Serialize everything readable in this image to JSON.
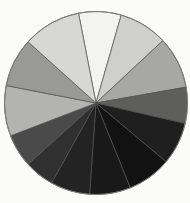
{
  "figure": {
    "background": "#fbfbfa",
    "outline_color": "#7a7a78",
    "divider_color": "#4f4f4f"
  },
  "chart_data": {
    "type": "pie",
    "title": "",
    "xlabel": "",
    "ylabel": "",
    "legend": "none",
    "data_labels": "none",
    "angle_unit": "degrees clockwise from 12 o'clock",
    "center": {
      "x": 96,
      "y": 103
    },
    "radius": 91.5,
    "slices": [
      {
        "name": "slice-white-top",
        "start": 349,
        "end": 16,
        "sweep_deg": 27,
        "pct": 7.5,
        "fill": "#f3f3f1"
      },
      {
        "name": "slice-light-gray-1",
        "start": 16,
        "end": 47,
        "sweep_deg": 31,
        "pct": 8.6,
        "fill": "#cfcfcd"
      },
      {
        "name": "slice-medium-gray-1",
        "start": 47,
        "end": 80,
        "sweep_deg": 33,
        "pct": 9.2,
        "fill": "#a7a7a5"
      },
      {
        "name": "slice-dark-gray-right",
        "start": 80,
        "end": 103,
        "sweep_deg": 23,
        "pct": 6.4,
        "fill": "#5e5e5c"
      },
      {
        "name": "slice-near-black-1",
        "start": 103,
        "end": 130,
        "sweep_deg": 27,
        "pct": 7.5,
        "fill": "#1f1f1f"
      },
      {
        "name": "slice-near-black-2",
        "start": 130,
        "end": 158,
        "sweep_deg": 28,
        "pct": 7.8,
        "fill": "#121212"
      },
      {
        "name": "slice-near-black-3",
        "start": 158,
        "end": 184,
        "sweep_deg": 26,
        "pct": 7.2,
        "fill": "#191919"
      },
      {
        "name": "slice-near-black-4",
        "start": 184,
        "end": 209,
        "sweep_deg": 25,
        "pct": 6.9,
        "fill": "#232323"
      },
      {
        "name": "slice-very-dark-left",
        "start": 209,
        "end": 228,
        "sweep_deg": 19,
        "pct": 5.3,
        "fill": "#303030"
      },
      {
        "name": "slice-dark-gray-left",
        "start": 228,
        "end": 249,
        "sweep_deg": 21,
        "pct": 5.8,
        "fill": "#4a4a4a"
      },
      {
        "name": "slice-light-med-gray",
        "start": 249,
        "end": 281,
        "sweep_deg": 32,
        "pct": 8.9,
        "fill": "#b3b3b1"
      },
      {
        "name": "slice-medium-gray-2",
        "start": 281,
        "end": 312,
        "sweep_deg": 31,
        "pct": 8.6,
        "fill": "#999997"
      },
      {
        "name": "slice-light-gray-2",
        "start": 312,
        "end": 349,
        "sweep_deg": 37,
        "pct": 10.3,
        "fill": "#d7d7d5"
      }
    ]
  }
}
